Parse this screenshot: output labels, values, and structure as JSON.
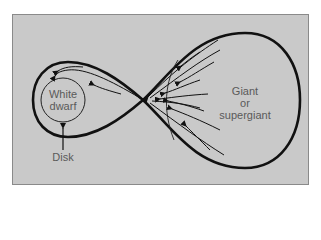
{
  "figure": {
    "labels": {
      "white_dwarf_line1": "White",
      "white_dwarf_line2": "dwarf",
      "disk": "Disk",
      "giant_line1": "Giant",
      "giant_line2": "or",
      "giant_line3": "supergiant"
    },
    "colors": {
      "background": "#c9c9c9",
      "frame_border": "#8a8a8a",
      "outline": "#111111",
      "label_text": "#5a5a5a"
    },
    "elements": {
      "roche_lobe_left": "white dwarf Roche lobe",
      "roche_lobe_right": "giant Roche lobe",
      "lagrange_point": "inner Lagrangian point",
      "white_dwarf": "white dwarf circle",
      "accretion_flow": "gas stream arrows toward white dwarf",
      "disk_pointer": "arrow to disk"
    }
  }
}
